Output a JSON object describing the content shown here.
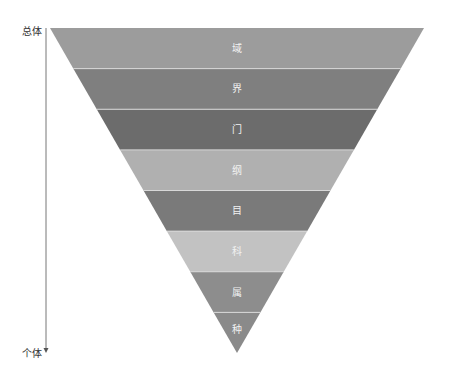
{
  "diagram": {
    "type": "inverted-pyramid",
    "axis": {
      "top_label": "总体",
      "bottom_label": "个体",
      "color": "#777777"
    },
    "triangle": {
      "top_y": 28,
      "left_x": 50,
      "right_x": 424,
      "apex_x": 237,
      "apex_y": 353
    },
    "levels": [
      {
        "label": "域",
        "color": "#9c9c9c"
      },
      {
        "label": "界",
        "color": "#7f7f7f"
      },
      {
        "label": "门",
        "color": "#6c6c6c"
      },
      {
        "label": "纲",
        "color": "#b0b0b0"
      },
      {
        "label": "目",
        "color": "#7a7a7a"
      },
      {
        "label": "科",
        "color": "#c2c2c2"
      },
      {
        "label": "属",
        "color": "#8d8d8d"
      },
      {
        "label": "种",
        "color": "#8a8a8a"
      }
    ],
    "separator_color": "#d8d8d8",
    "text_color": "#f2f2f2"
  }
}
